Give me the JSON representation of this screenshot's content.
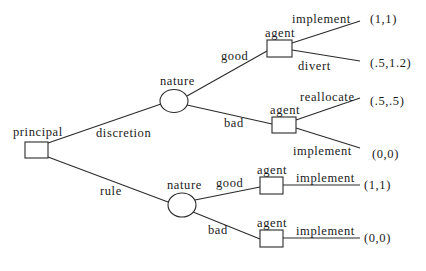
{
  "diagram": {
    "type": "game-tree",
    "root": {
      "player": "principal",
      "choices": [
        {
          "label": "discretion",
          "node": {
            "player": "nature",
            "outcomes": [
              {
                "label": "good",
                "node": {
                  "player": "agent",
                  "actions": [
                    {
                      "label": "implement",
                      "payoff": "(1,1)"
                    },
                    {
                      "label": "divert",
                      "payoff": "(.5,1.2)"
                    }
                  ]
                }
              },
              {
                "label": "bad",
                "node": {
                  "player": "agent",
                  "actions": [
                    {
                      "label": "reallocate",
                      "payoff": "(.5,.5)"
                    },
                    {
                      "label": "implement",
                      "payoff": "(0,0)"
                    }
                  ]
                }
              }
            ]
          }
        },
        {
          "label": "rule",
          "node": {
            "player": "nature",
            "outcomes": [
              {
                "label": "good",
                "node": {
                  "player": "agent",
                  "actions": [
                    {
                      "label": "implement",
                      "payoff": "(1,1)"
                    }
                  ]
                }
              },
              {
                "label": "bad",
                "node": {
                  "player": "agent",
                  "actions": [
                    {
                      "label": "implement",
                      "payoff": "(0,0)"
                    }
                  ]
                }
              }
            ]
          }
        }
      ]
    }
  }
}
